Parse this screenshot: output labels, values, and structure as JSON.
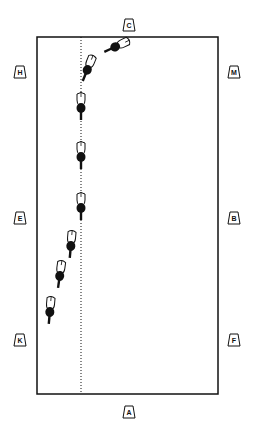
{
  "diagram": {
    "type": "dressage-arena",
    "colors": {
      "line": "#111111",
      "background": "#ffffff"
    },
    "arena": {
      "x": 37,
      "y": 37,
      "width": 181,
      "height": 357
    },
    "centerline_x": 81,
    "markers": [
      {
        "letter": "C",
        "x": 129,
        "y": 25
      },
      {
        "letter": "H",
        "x": 20,
        "y": 72
      },
      {
        "letter": "M",
        "x": 234,
        "y": 72
      },
      {
        "letter": "E",
        "x": 20,
        "y": 218
      },
      {
        "letter": "B",
        "x": 234,
        "y": 218
      },
      {
        "letter": "K",
        "x": 20,
        "y": 340
      },
      {
        "letter": "F",
        "x": 234,
        "y": 340
      },
      {
        "letter": "A",
        "x": 129,
        "y": 412
      }
    ],
    "horses": [
      {
        "x": 117,
        "y": 46,
        "rotate": 65
      },
      {
        "x": 88,
        "y": 68,
        "rotate": 22
      },
      {
        "x": 81,
        "y": 106,
        "rotate": 0
      },
      {
        "x": 81,
        "y": 155,
        "rotate": 0
      },
      {
        "x": 81,
        "y": 206,
        "rotate": 0
      },
      {
        "x": 71,
        "y": 244,
        "rotate": 5
      },
      {
        "x": 60,
        "y": 274,
        "rotate": 8
      },
      {
        "x": 50,
        "y": 310,
        "rotate": 5
      }
    ]
  }
}
